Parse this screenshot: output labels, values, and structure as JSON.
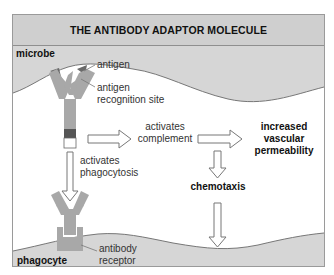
{
  "title": "THE ANTIBODY ADAPTOR MOLECULE",
  "regions": {
    "top": "microbe",
    "bottom": "phagocyte"
  },
  "labels": {
    "antigen": "antigen",
    "antigen_site_1": "antigen",
    "antigen_site_2": "recognition site",
    "complement_1": "activates",
    "complement_2": "complement",
    "phagocytosis_1": "activates",
    "phagocytosis_2": "phagocytosis",
    "permeability_1": "increased",
    "permeability_2": "vascular",
    "permeability_3": "permeability",
    "chemotaxis": "chemotaxis",
    "receptor_1": "antibody",
    "receptor_2": "receptor"
  },
  "colors": {
    "title_bg": "#cfcfcf",
    "cell_fill": "#d6d6d6",
    "antibody_fill": "#a8a8a8",
    "hinge_dark": "#555555",
    "antigen_dark": "#6a6a6a"
  }
}
